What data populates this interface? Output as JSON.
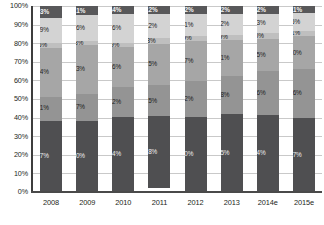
{
  "chart_data": {
    "type": "bar",
    "stacked": true,
    "stack_mode": "percent",
    "title": "",
    "subtitle": "",
    "xlabel": "",
    "ylabel": "",
    "ylim": [
      0,
      100
    ],
    "grid": true,
    "legend": "none",
    "categories": [
      "2008",
      "2009",
      "2010",
      "2011",
      "2012",
      "2013",
      "2014e",
      "2015e"
    ],
    "ytick_labels": [
      "100%",
      "90%",
      "80%",
      "70%",
      "60%",
      "50%",
      "40%",
      "30%",
      "20%",
      "10%",
      "0%"
    ],
    "ytick_values": [
      100,
      90,
      80,
      70,
      60,
      50,
      40,
      30,
      20,
      10,
      0
    ],
    "series": [
      {
        "name": "Segment 6",
        "color": "#58585a",
        "order_from_top": 1,
        "values": [
          6.3,
          5.1,
          4.4,
          4.2,
          4.2,
          4.2,
          4.2,
          4.1
        ],
        "labels": [
          "6.3%",
          "5.1%",
          "4.4%",
          "4.2%",
          "4.2%",
          "4.2%",
          "4.2%",
          "4.1%"
        ]
      },
      {
        "name": "Segment 5",
        "color": "#d3d3d3",
        "order_from_top": 2,
        "values": [
          13.9,
          13.6,
          15.6,
          13.2,
          12.1,
          11.2,
          10.3,
          9.5
        ],
        "labels": [
          "13.9%",
          "13.6%",
          "15.6%",
          "13.2%",
          "12.1%",
          "11.2%",
          "10.3%",
          "9.5%"
        ]
      },
      {
        "name": "Segment 4",
        "color": "#bfbfbf",
        "order_from_top": 3,
        "values": [
          2.6,
          2.3,
          1.9,
          2.8,
          2.9,
          2.9,
          3.0,
          3.1
        ],
        "labels": [
          "2.6%",
          "2.3%",
          "1.9%",
          "2.8%",
          "2.9%",
          "2.9%",
          "3.0%",
          "3.1%"
        ]
      },
      {
        "name": "Segment 3",
        "color": "#a6a6a6",
        "order_from_top": 4,
        "values": [
          26.4,
          26.3,
          21.6,
          22.5,
          21.7,
          19.1,
          17.5,
          18.0
        ],
        "labels": [
          "26.4%",
          "26.3%",
          "21.6%",
          "22.5%",
          "21.7%",
          "19.1%",
          "17.5%",
          "18.0%"
        ]
      },
      {
        "name": "Segment 2",
        "color": "#949494",
        "order_from_top": 5,
        "values": [
          13.1,
          14.7,
          16.2,
          16.5,
          19.2,
          20.8,
          23.6,
          26.6
        ],
        "labels": [
          "13.1%",
          "14.7%",
          "16.2%",
          "16.5%",
          "19.2%",
          "20.8%",
          "23.6%",
          "26.6%"
        ]
      },
      {
        "name": "Segment 1",
        "color": "#4f4f51",
        "order_from_top": 6,
        "values": [
          38.7,
          38.0,
          40.4,
          38.8,
          41.0,
          41.5,
          41.4,
          40.7
        ],
        "labels": [
          "38.7%",
          "38.0%",
          "40.4%",
          "38.8%",
          "41.0%",
          "41.5%",
          "41.4%",
          "40.7%"
        ]
      }
    ]
  },
  "colors": {
    "axis": "#3d3d3d",
    "gridline": "#c9c9c9",
    "background": "#ffffff",
    "label_dark": "#232323",
    "label_light": "#f0f0f0"
  }
}
